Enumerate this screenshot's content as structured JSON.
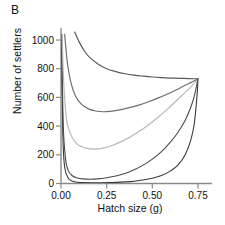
{
  "panel": {
    "label": "B"
  },
  "axes": {
    "xlabel": "Hatch size (g)",
    "ylabel": "Number of settlers",
    "xticks": [
      "0.00",
      "0.25",
      "0.50",
      "0.75"
    ],
    "yticks": [
      "0",
      "200",
      "400",
      "600",
      "800",
      "1000"
    ]
  },
  "chart_data": {
    "type": "line",
    "title": "B",
    "xlabel": "Hatch size (g)",
    "ylabel": "Number of settlers",
    "xlim": [
      0.0,
      0.78
    ],
    "ylim": [
      0,
      1060
    ],
    "xticks": [
      0.0,
      0.25,
      0.5,
      0.75
    ],
    "yticks": [
      0,
      200,
      400,
      600,
      800,
      1000
    ],
    "grid": false,
    "legend": null,
    "convergence_point": [
      0.75,
      730
    ],
    "series": [
      {
        "name": "curve-1-lowest",
        "color": "#3a3a3a",
        "linewidth": 1.1,
        "x": [
          0.003,
          0.01,
          0.02,
          0.04,
          0.06,
          0.09,
          0.12,
          0.16,
          0.2,
          0.25,
          0.3,
          0.35,
          0.4,
          0.45,
          0.5,
          0.55,
          0.6,
          0.64,
          0.68,
          0.71,
          0.73,
          0.745,
          0.75
        ],
        "y": [
          1040,
          340,
          115,
          36,
          18,
          9,
          6,
          5,
          5,
          6,
          8,
          11,
          16,
          24,
          36,
          55,
          88,
          128,
          200,
          300,
          420,
          620,
          730
        ]
      },
      {
        "name": "curve-2",
        "color": "#4a4a4a",
        "linewidth": 1.1,
        "x": [
          0.004,
          0.012,
          0.025,
          0.04,
          0.06,
          0.09,
          0.12,
          0.16,
          0.2,
          0.25,
          0.3,
          0.35,
          0.4,
          0.45,
          0.5,
          0.55,
          0.6,
          0.64,
          0.68,
          0.71,
          0.73,
          0.745,
          0.75
        ],
        "y": [
          1040,
          420,
          170,
          90,
          56,
          38,
          32,
          30,
          32,
          40,
          52,
          70,
          95,
          128,
          170,
          222,
          290,
          355,
          440,
          530,
          610,
          700,
          730
        ]
      },
      {
        "name": "curve-3-light",
        "color": "#b8b8b8",
        "linewidth": 1.2,
        "x": [
          0.006,
          0.015,
          0.03,
          0.05,
          0.08,
          0.11,
          0.15,
          0.19,
          0.23,
          0.28,
          0.33,
          0.38,
          0.43,
          0.48,
          0.53,
          0.58,
          0.63,
          0.68,
          0.71,
          0.73,
          0.75
        ],
        "y": [
          1040,
          700,
          450,
          350,
          285,
          258,
          243,
          240,
          247,
          265,
          292,
          325,
          365,
          410,
          460,
          515,
          575,
          635,
          672,
          700,
          730
        ]
      },
      {
        "name": "curve-4",
        "color": "#6e6e6e",
        "linewidth": 1.2,
        "x": [
          0.02,
          0.035,
          0.055,
          0.08,
          0.11,
          0.15,
          0.19,
          0.23,
          0.28,
          0.33,
          0.38,
          0.43,
          0.48,
          0.53,
          0.58,
          0.63,
          0.68,
          0.71,
          0.73,
          0.75
        ],
        "y": [
          1040,
          840,
          700,
          608,
          555,
          520,
          505,
          500,
          505,
          515,
          530,
          548,
          570,
          595,
          622,
          652,
          685,
          703,
          716,
          730
        ]
      },
      {
        "name": "curve-5-highest",
        "color": "#5a5a5a",
        "linewidth": 1.2,
        "x": [
          0.075,
          0.1,
          0.13,
          0.16,
          0.2,
          0.25,
          0.3,
          0.35,
          0.4,
          0.45,
          0.5,
          0.55,
          0.6,
          0.65,
          0.7,
          0.73,
          0.75
        ],
        "y": [
          1055,
          985,
          920,
          875,
          835,
          800,
          780,
          765,
          755,
          748,
          742,
          738,
          735,
          733,
          731,
          730,
          730
        ]
      }
    ]
  }
}
